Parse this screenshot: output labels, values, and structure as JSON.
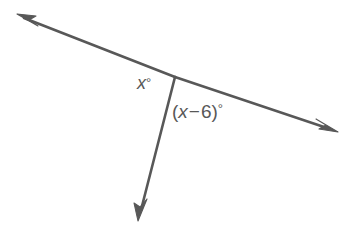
{
  "figure": {
    "type": "geometry-angle-diagram",
    "background_color": "#ffffff",
    "stroke_color": "#585858",
    "stroke_width": 2.6,
    "width": 352,
    "height": 240
  },
  "labels": {
    "angle_left": {
      "name": "x-angle-label",
      "variable": "x",
      "degree_symbol": "°",
      "full_text": "x°",
      "x": 137,
      "y": 74
    },
    "angle_right": {
      "name": "x-minus-6-angle-label",
      "open_paren": "(",
      "variable": "x",
      "operator": "−",
      "number": "6",
      "close_paren": ")",
      "degree_symbol": "°",
      "full_text": "(x − 6)°",
      "x": 172,
      "y": 102
    }
  },
  "geometry": {
    "vertex": {
      "x": 175,
      "y": 77
    },
    "rays": [
      {
        "name": "ray-upper-left",
        "from": {
          "x": 175,
          "y": 77
        },
        "to": {
          "x": 22,
          "y": 17
        },
        "arrow_tip": {
          "x": 17,
          "y": 14
        },
        "has_arrowhead": true
      },
      {
        "name": "ray-lower-right",
        "from": {
          "x": 175,
          "y": 77
        },
        "to": {
          "x": 332,
          "y": 130
        },
        "arrow_tip": {
          "x": 338,
          "y": 132
        },
        "has_arrowhead": true
      },
      {
        "name": "ray-downward",
        "from": {
          "x": 175,
          "y": 77
        },
        "to": {
          "x": 141,
          "y": 211
        },
        "arrow_tip": {
          "x": 138,
          "y": 221
        },
        "has_arrowhead": true
      }
    ]
  }
}
